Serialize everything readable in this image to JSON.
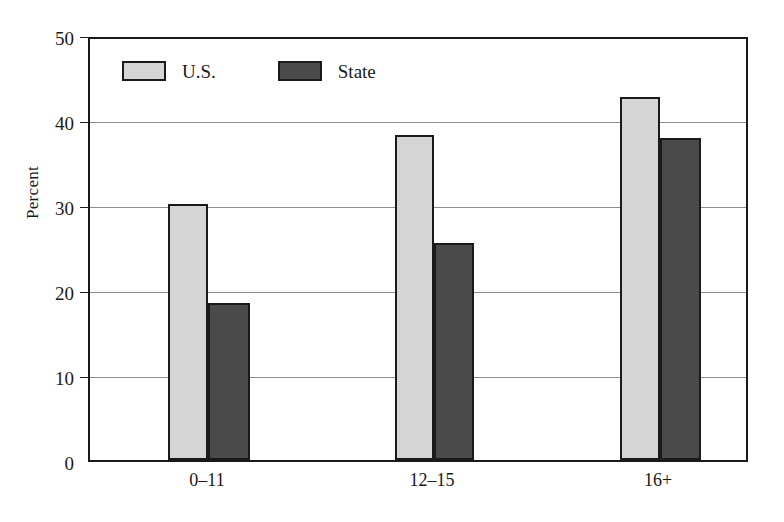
{
  "chart_data": {
    "type": "bar",
    "title": "",
    "subtitle": "",
    "xlabel": "",
    "ylabel": "Percent",
    "categories": [
      "0–11",
      "12–15",
      "16+"
    ],
    "series": [
      {
        "name": "U.S.",
        "values": [
          30.4,
          38.6,
          43.1
        ],
        "color": "#d5d5d5"
      },
      {
        "name": "State",
        "values": [
          18.6,
          25.8,
          38.2
        ],
        "color": "#4a4a4a"
      }
    ],
    "ylim": [
      0,
      50
    ],
    "ytick_values": [
      0,
      10,
      20,
      30,
      40,
      50
    ],
    "ytick_labels": [
      "0",
      "10",
      "20",
      "30",
      "40",
      "50"
    ],
    "grid": true,
    "grid_axis": "y",
    "legend_position": "upper left inside",
    "annotations": []
  },
  "axes": {
    "y_title": "Percent",
    "y_ticks": [
      {
        "label": "50",
        "value": 50
      },
      {
        "label": "40",
        "value": 40
      },
      {
        "label": "30",
        "value": 30
      },
      {
        "label": "20",
        "value": 20
      },
      {
        "label": "10",
        "value": 10
      },
      {
        "label": "0",
        "value": 0
      }
    ],
    "x_ticks": [
      {
        "label": "0–11"
      },
      {
        "label": "12–15"
      },
      {
        "label": "16+"
      }
    ]
  },
  "legend": {
    "entries": [
      {
        "label": "U.S.",
        "color": "#d5d5d5"
      },
      {
        "label": "State",
        "color": "#4a4a4a"
      }
    ]
  },
  "style": {
    "bar_border_color": "#1a1a1a",
    "gridline_color": "#8d8d8d",
    "frame_color": "#1a1a1a",
    "background": "#ffffff"
  }
}
